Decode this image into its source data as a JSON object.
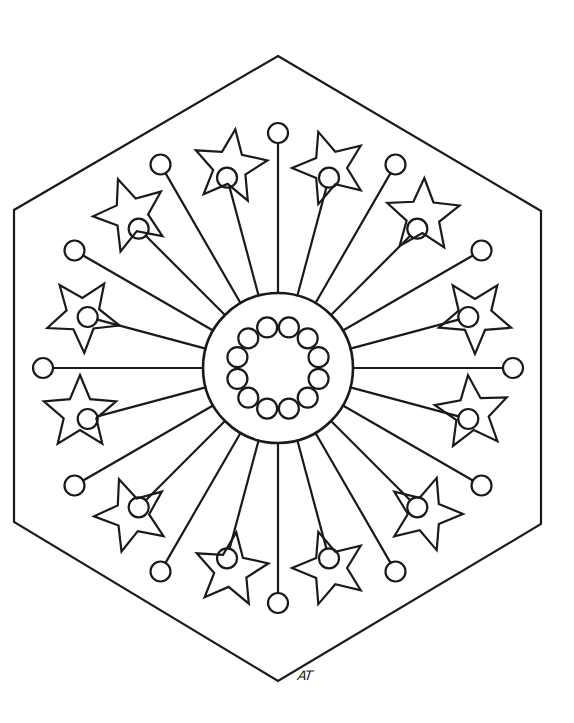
{
  "artwork": {
    "type": "coloring-page-mandala",
    "signature": "AT",
    "ink_color": "#1a1a1a",
    "background_color": "#ffffff",
    "hexagon": {
      "points": [
        [
          278,
          56
        ],
        [
          541,
          211
        ],
        [
          541,
          524
        ],
        [
          278,
          681
        ],
        [
          14,
          522
        ],
        [
          14,
          210
        ]
      ]
    },
    "center": {
      "x": 278,
      "y": 368
    },
    "hub_circle_radius": 75,
    "inner_ring": {
      "count": 12,
      "ring_radius": 42,
      "circle_radius": 10
    },
    "spokes": {
      "count": 24,
      "long_length": 160,
      "short_length": 122,
      "bulb_radius": 10,
      "start_radius": 75
    },
    "stars": [
      {
        "cx": 230,
        "cy": 167,
        "r": 38,
        "rotation": 8
      },
      {
        "cx": 330,
        "cy": 168,
        "r": 38,
        "rotation": -18
      },
      {
        "cx": 131,
        "cy": 215,
        "r": 38,
        "rotation": -20
      },
      {
        "cx": 423,
        "cy": 216,
        "r": 38,
        "rotation": 2
      },
      {
        "cx": 83,
        "cy": 315,
        "r": 38,
        "rotation": 34
      },
      {
        "cx": 475,
        "cy": 316,
        "r": 38,
        "rotation": 36
      },
      {
        "cx": 80,
        "cy": 413,
        "r": 38,
        "rotation": 0
      },
      {
        "cx": 472,
        "cy": 413,
        "r": 38,
        "rotation": -6
      },
      {
        "cx": 132,
        "cy": 515,
        "r": 38,
        "rotation": -20
      },
      {
        "cx": 425,
        "cy": 514,
        "r": 38,
        "rotation": 18
      },
      {
        "cx": 231,
        "cy": 570,
        "r": 38,
        "rotation": 8
      },
      {
        "cx": 330,
        "cy": 568,
        "r": 38,
        "rotation": -18
      }
    ]
  }
}
